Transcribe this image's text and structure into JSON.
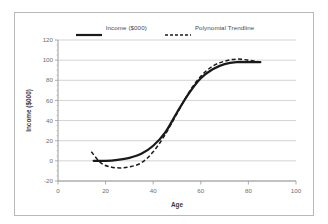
{
  "chart_data": {
    "type": "line",
    "title": "",
    "xlabel": "Age",
    "ylabel": "Income ($000)",
    "xlim": [
      0,
      100
    ],
    "ylim": [
      -20,
      120
    ],
    "xticks": [
      "0",
      "20",
      "40",
      "60",
      "80",
      "100"
    ],
    "yticks": [
      "-20",
      "0",
      "20",
      "40",
      "60",
      "80",
      "100",
      "120"
    ],
    "grid": "horizontal",
    "legend_position": "top-center",
    "series": [
      {
        "name": "Income ($000)",
        "style": "solid",
        "color": "#1a1a1a",
        "x": [
          15,
          20,
          25,
          30,
          35,
          40,
          45,
          50,
          55,
          60,
          65,
          70,
          75,
          80,
          85
        ],
        "values": [
          0,
          0,
          1,
          3,
          7,
          15,
          28,
          48,
          67,
          82,
          91,
          96,
          98,
          98,
          98
        ]
      },
      {
        "name": "Polynomial Trendline",
        "style": "dashed",
        "color": "#1a1a1a",
        "x": [
          14,
          18,
          22,
          26,
          30,
          35,
          40,
          45,
          50,
          55,
          60,
          65,
          70,
          75,
          80,
          85
        ],
        "values": [
          9,
          -2,
          -6,
          -7,
          -6,
          -2,
          9,
          26,
          47,
          68,
          84,
          94,
          99,
          101,
          100,
          98
        ]
      }
    ]
  },
  "legend": {
    "entries": [
      {
        "label": "Income ($000)"
      },
      {
        "label": "Polynomial Trendline"
      }
    ]
  },
  "axes": {
    "x_title": "Age",
    "y_title": "Income ($000)"
  }
}
